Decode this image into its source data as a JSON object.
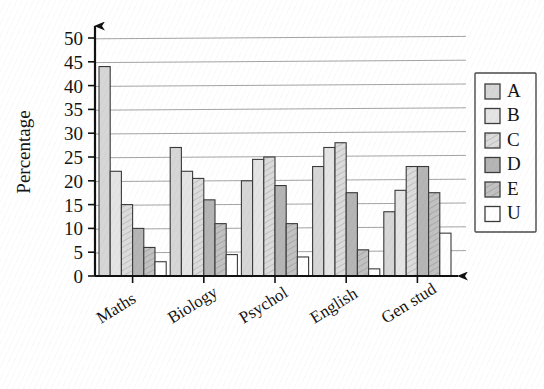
{
  "chart_data": {
    "type": "bar",
    "title": "",
    "xlabel": "",
    "ylabel": "Percentage",
    "ylim": [
      0,
      50
    ],
    "ytick_step": 5,
    "grid": true,
    "legend_position": "right",
    "categories": [
      "Maths",
      "Biology",
      "Psychol",
      "English",
      "Gen stud"
    ],
    "series": [
      {
        "name": "A",
        "values": [
          44,
          27,
          20,
          23,
          13.5
        ]
      },
      {
        "name": "B",
        "values": [
          22,
          22,
          24.5,
          27,
          18
        ]
      },
      {
        "name": "C",
        "values": [
          15,
          20.5,
          25,
          28,
          23
        ]
      },
      {
        "name": "D",
        "values": [
          10,
          16,
          19,
          17.5,
          23
        ]
      },
      {
        "name": "E",
        "values": [
          6,
          11,
          11,
          5.5,
          17.5
        ]
      },
      {
        "name": "U",
        "values": [
          3,
          4.5,
          4,
          1.5,
          9
        ]
      }
    ],
    "ytick_labels": [
      "0",
      "5",
      "10",
      "15",
      "20",
      "25",
      "30",
      "35",
      "40",
      "45",
      "50"
    ]
  },
  "legend": {
    "items": [
      {
        "label": "A",
        "fill": "#d6d6d6",
        "hatch": false
      },
      {
        "label": "B",
        "fill": "#e4e4e4",
        "hatch": false
      },
      {
        "label": "C",
        "fill": "#dcdcdc",
        "hatch": true
      },
      {
        "label": "D",
        "fill": "#b5b5b5",
        "hatch": false
      },
      {
        "label": "E",
        "fill": "#c2c2c2",
        "hatch": true
      },
      {
        "label": "U",
        "fill": "#ffffff",
        "hatch": false
      }
    ]
  },
  "colors": {
    "axis": "#111111",
    "gridline": "#8d8d8d",
    "bar_stroke": "#3a3a3a",
    "background": "#ffffff"
  }
}
